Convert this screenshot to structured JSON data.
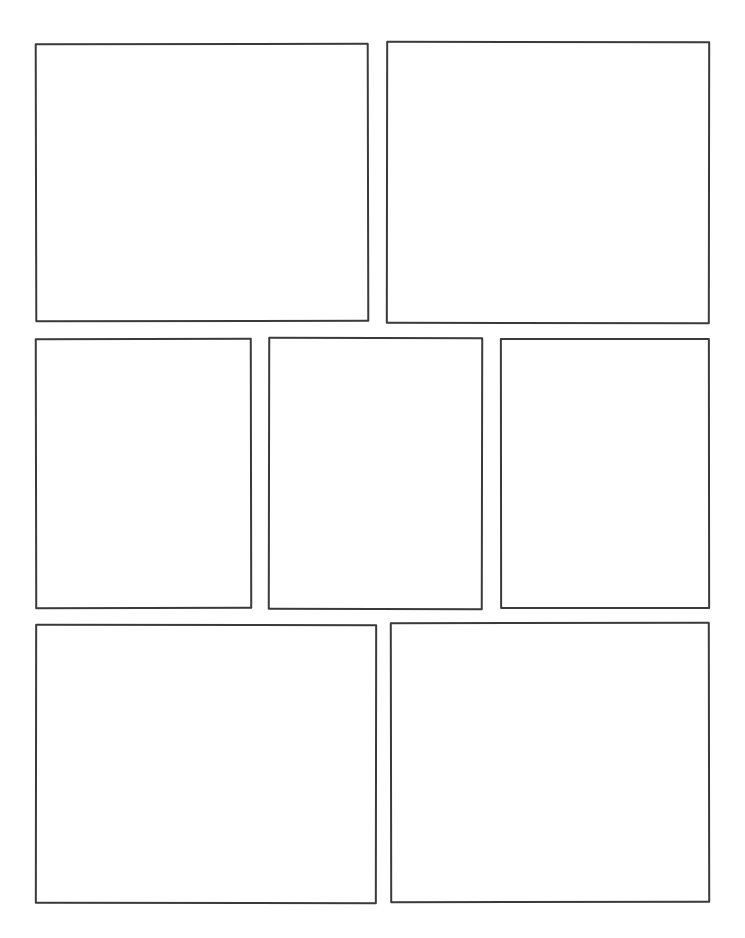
{
  "page": {
    "document_type": "comic-page-template",
    "background_color": "#ffffff",
    "stroke_color": "#3a3a3a",
    "stroke_width_px": 2,
    "width_px": 745,
    "height_px": 938,
    "panel_count": 7,
    "row_count": 3
  },
  "rows": [
    {
      "id": "row-1",
      "panel_count": 2
    },
    {
      "id": "row-2",
      "panel_count": 3
    },
    {
      "id": "row-3",
      "panel_count": 2
    }
  ],
  "panels": [
    {
      "id": "panel-1",
      "row": 1,
      "index_in_row": 1,
      "shape": "rectangle",
      "content": "",
      "x": 35,
      "y": 43,
      "width": 334,
      "height": 279
    },
    {
      "id": "panel-2",
      "row": 1,
      "index_in_row": 2,
      "shape": "rectangle",
      "content": "",
      "x": 386,
      "y": 41,
      "width": 324,
      "height": 283
    },
    {
      "id": "panel-3",
      "row": 2,
      "index_in_row": 1,
      "shape": "rectangle",
      "content": "",
      "x": 35,
      "y": 338,
      "width": 217,
      "height": 271
    },
    {
      "id": "panel-4",
      "row": 2,
      "index_in_row": 2,
      "shape": "rectangle",
      "content": "",
      "x": 268,
      "y": 337,
      "width": 215,
      "height": 273
    },
    {
      "id": "panel-5",
      "row": 2,
      "index_in_row": 3,
      "shape": "rectangle",
      "content": "",
      "x": 500,
      "y": 338,
      "width": 210,
      "height": 271
    },
    {
      "id": "panel-6",
      "row": 3,
      "index_in_row": 1,
      "shape": "rectangle",
      "content": "",
      "x": 35,
      "y": 624,
      "width": 342,
      "height": 280
    },
    {
      "id": "panel-7",
      "row": 3,
      "index_in_row": 2,
      "shape": "rectangle",
      "content": "",
      "x": 390,
      "y": 622,
      "width": 320,
      "height": 281
    }
  ]
}
